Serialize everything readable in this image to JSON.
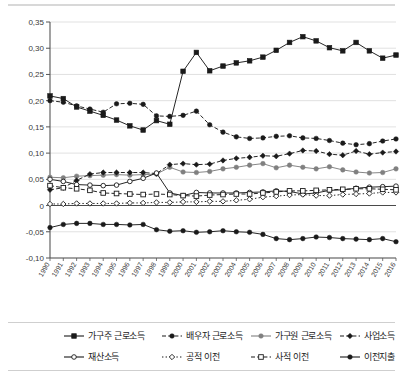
{
  "chart_data": {
    "type": "line",
    "title": "",
    "xlabel": "",
    "ylabel": "",
    "ylim": [
      -0.1,
      0.35
    ],
    "ytick_labels": [
      "0,35",
      "0,30",
      "0,25",
      "0,20",
      "0,15",
      "0,10",
      "0,05",
      "0",
      "-0,05",
      "-0,10"
    ],
    "ytick_values": [
      0.35,
      0.3,
      0.25,
      0.2,
      0.15,
      0.1,
      0.05,
      0,
      -0.05,
      -0.1
    ],
    "grid": true,
    "legend_position": "bottom",
    "decimal_separator": ",",
    "categories": [
      "1990",
      "1991",
      "1992",
      "1993",
      "1994",
      "1995",
      "1996",
      "1997",
      "1998",
      "1999",
      "2000",
      "2001",
      "2002",
      "2003",
      "2004",
      "2005",
      "2006",
      "2007",
      "2008",
      "2009",
      "2010",
      "2011",
      "2012",
      "2013",
      "2014",
      "2015",
      "2016"
    ],
    "series": [
      {
        "name": "가구주 근로소득",
        "marker": "filled-square",
        "line": "solid",
        "values": [
          0.209,
          0.204,
          0.188,
          0.18,
          0.172,
          0.163,
          0.152,
          0.144,
          0.162,
          0.155,
          0.256,
          0.292,
          0.257,
          0.266,
          0.272,
          0.276,
          0.283,
          0.296,
          0.311,
          0.322,
          0.314,
          0.301,
          0.295,
          0.311,
          0.295,
          0.281,
          0.287
        ]
      },
      {
        "name": "배우자 근로소득",
        "marker": "filled-circle",
        "line": "dashed",
        "values": [
          0.2,
          0.197,
          0.19,
          0.184,
          0.178,
          0.194,
          0.195,
          0.193,
          0.171,
          0.17,
          0.172,
          0.18,
          0.154,
          0.14,
          0.131,
          0.128,
          0.129,
          0.132,
          0.133,
          0.129,
          0.128,
          0.124,
          0.119,
          0.116,
          0.118,
          0.123,
          0.127
        ]
      },
      {
        "name": "가구원 근로소득",
        "marker": "filled-circle-gray",
        "line": "solid",
        "values": [
          0.054,
          0.053,
          0.056,
          0.057,
          0.058,
          0.059,
          0.058,
          0.059,
          0.06,
          0.073,
          0.064,
          0.063,
          0.065,
          0.07,
          0.073,
          0.077,
          0.08,
          0.072,
          0.077,
          0.073,
          0.07,
          0.074,
          0.068,
          0.064,
          0.062,
          0.063,
          0.07
        ]
      },
      {
        "name": "사업소득",
        "marker": "filled-diamond",
        "line": "dashed",
        "values": [
          0.03,
          0.034,
          0.048,
          0.06,
          0.063,
          0.063,
          0.063,
          0.063,
          0.061,
          0.078,
          0.08,
          0.078,
          0.079,
          0.086,
          0.09,
          0.092,
          0.095,
          0.094,
          0.099,
          0.105,
          0.104,
          0.098,
          0.096,
          0.104,
          0.098,
          0.101,
          0.103
        ]
      },
      {
        "name": "재산소득",
        "marker": "open-circle",
        "line": "solid",
        "values": [
          0.05,
          0.046,
          0.04,
          0.039,
          0.038,
          0.039,
          0.046,
          0.052,
          0.062,
          0.024,
          0.019,
          0.025,
          0.024,
          0.024,
          0.024,
          0.025,
          0.026,
          0.028,
          0.027,
          0.022,
          0.024,
          0.029,
          0.03,
          0.033,
          0.035,
          0.036,
          0.037
        ]
      },
      {
        "name": "공적 이전",
        "marker": "open-diamond",
        "line": "dotted",
        "values": [
          0.003,
          0.003,
          0.004,
          0.004,
          0.004,
          0.004,
          0.005,
          0.005,
          0.006,
          0.006,
          0.007,
          0.007,
          0.008,
          0.008,
          0.01,
          0.012,
          0.016,
          0.018,
          0.02,
          0.021,
          0.019,
          0.019,
          0.021,
          0.022,
          0.023,
          0.025,
          0.025
        ]
      },
      {
        "name": "사적 이전",
        "marker": "open-square",
        "line": "dashed",
        "values": [
          0.038,
          0.034,
          0.032,
          0.029,
          0.024,
          0.023,
          0.022,
          0.021,
          0.022,
          0.021,
          0.019,
          0.018,
          0.02,
          0.021,
          0.022,
          0.022,
          0.024,
          0.026,
          0.028,
          0.028,
          0.029,
          0.03,
          0.031,
          0.032,
          0.032,
          0.031,
          0.03
        ]
      },
      {
        "name": "이전지출",
        "marker": "filled-circle",
        "line": "solid",
        "values": [
          -0.042,
          -0.036,
          -0.034,
          -0.034,
          -0.036,
          -0.036,
          -0.037,
          -0.036,
          -0.046,
          -0.049,
          -0.048,
          -0.051,
          -0.05,
          -0.048,
          -0.05,
          -0.051,
          -0.055,
          -0.063,
          -0.065,
          -0.063,
          -0.06,
          -0.061,
          -0.063,
          -0.064,
          -0.065,
          -0.063,
          -0.069
        ]
      }
    ]
  },
  "legend": {
    "items": [
      {
        "label": "가구주 근로소득",
        "marker": "filled-square",
        "line": "solid"
      },
      {
        "label": "배우자 근로소득",
        "marker": "filled-circle",
        "line": "dashed"
      },
      {
        "label": "가구원 근로소득",
        "marker": "filled-circle-gray",
        "line": "solid"
      },
      {
        "label": "사업소득",
        "marker": "filled-diamond",
        "line": "dashed"
      },
      {
        "label": "재산소득",
        "marker": "open-circle",
        "line": "solid"
      },
      {
        "label": "공적 이전",
        "marker": "open-diamond",
        "line": "dotted"
      },
      {
        "label": "사적 이전",
        "marker": "open-square",
        "line": "dashed"
      },
      {
        "label": "이전지출",
        "marker": "filled-circle",
        "line": "solid"
      }
    ]
  },
  "colors": {
    "ink": "#1a1a1a",
    "gray_series": "#808080",
    "grid": "#d9d9d9",
    "axis": "#555555",
    "zero_line": "#4a4a4a",
    "background": "#ffffff"
  }
}
